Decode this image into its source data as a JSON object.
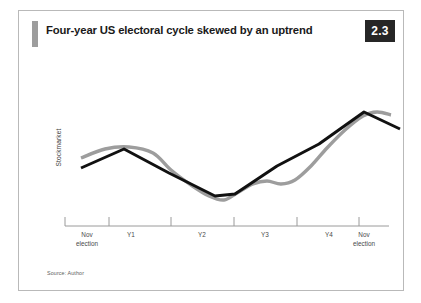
{
  "figure": {
    "title": "Four-year US electoral cycle skewed by an uptrend",
    "badge": "2.3",
    "source": "Source: Author",
    "accent_color": "#9d9d9d",
    "badge_bg": "#262626",
    "frame_color": "#b9b9b9"
  },
  "chart_data": {
    "type": "line",
    "title": "Four-year US electoral cycle skewed by an uptrend",
    "xlabel": "",
    "ylabel": "Stockmarket",
    "grid": false,
    "legend": "none",
    "axis": {
      "x_ticks": [
        "Nov election",
        "Y1",
        "Y2",
        "Y3",
        "Y4",
        "Nov election"
      ],
      "x_tick_lines": [
        {
          "label_line1": "Nov",
          "label_line2": "election"
        },
        {
          "label_line1": "Y1",
          "label_line2": ""
        },
        {
          "label_line1": "Y2",
          "label_line2": ""
        },
        {
          "label_line1": "Y3",
          "label_line2": ""
        },
        {
          "label_line1": "Y4",
          "label_line2": ""
        },
        {
          "label_line1": "Nov",
          "label_line2": "election"
        }
      ],
      "y_ticks": [],
      "y_axis_visible": false,
      "x_axis_visible": true
    },
    "series": [
      {
        "name": "trend",
        "color": "#111111",
        "width": 3.0,
        "style": "straight-segments",
        "points": [
          {
            "x": 62,
            "y": 120
          },
          {
            "x": 105,
            "y": 101
          },
          {
            "x": 150,
            "y": 125
          },
          {
            "x": 196,
            "y": 148
          },
          {
            "x": 216,
            "y": 146
          },
          {
            "x": 258,
            "y": 118
          },
          {
            "x": 300,
            "y": 96
          },
          {
            "x": 345,
            "y": 64
          },
          {
            "x": 381,
            "y": 81
          }
        ]
      },
      {
        "name": "electoral-cycle",
        "color": "#9d9d9d",
        "width": 3.4,
        "style": "wavy",
        "points": [
          {
            "x": 62,
            "y": 110
          },
          {
            "x": 86,
            "y": 101
          },
          {
            "x": 110,
            "y": 99
          },
          {
            "x": 134,
            "y": 105
          },
          {
            "x": 152,
            "y": 122
          },
          {
            "x": 172,
            "y": 137
          },
          {
            "x": 190,
            "y": 148
          },
          {
            "x": 205,
            "y": 152
          },
          {
            "x": 218,
            "y": 145
          },
          {
            "x": 234,
            "y": 136
          },
          {
            "x": 248,
            "y": 133
          },
          {
            "x": 262,
            "y": 136
          },
          {
            "x": 276,
            "y": 132
          },
          {
            "x": 292,
            "y": 118
          },
          {
            "x": 308,
            "y": 100
          },
          {
            "x": 326,
            "y": 82
          },
          {
            "x": 344,
            "y": 68
          },
          {
            "x": 358,
            "y": 64
          },
          {
            "x": 372,
            "y": 67
          }
        ]
      }
    ],
    "annotations": [],
    "note": "Black line shows the underlying uptrend; grey line shows the four-year electoral cycle skewed by that uptrend."
  }
}
